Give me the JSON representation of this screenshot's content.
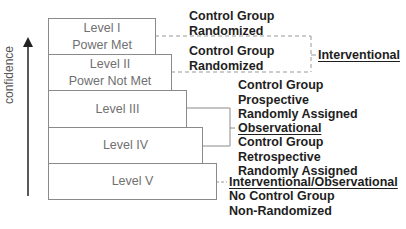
{
  "axis": {
    "label": "confidence",
    "direction": "up"
  },
  "levels": [
    {
      "name": "Level I",
      "sub": "Power Met"
    },
    {
      "name": "Level II",
      "sub": "Power Not Met"
    },
    {
      "name": "Level III",
      "sub": ""
    },
    {
      "name": "Level IV",
      "sub": ""
    },
    {
      "name": "Level V",
      "sub": ""
    }
  ],
  "descriptions": {
    "level1": [
      "Control Group",
      "Randomized"
    ],
    "level2": [
      "Control Group",
      "Randomized"
    ],
    "level3": [
      "Control Group",
      "Prospective",
      "Randomly Assigned"
    ],
    "level4": [
      "Control Group",
      "Retrospective",
      "Randomly Assigned"
    ],
    "level5": [
      "No Control Group",
      "Non-Randomized"
    ]
  },
  "categories": {
    "interventional": "Interventional",
    "observational": "Observational",
    "mixed": "Interventional/Observational"
  },
  "colors": {
    "box_border": "#8a8a8a",
    "box_text": "#707070",
    "label_text": "#1e1e1e",
    "connector": "#8a8a8a"
  }
}
